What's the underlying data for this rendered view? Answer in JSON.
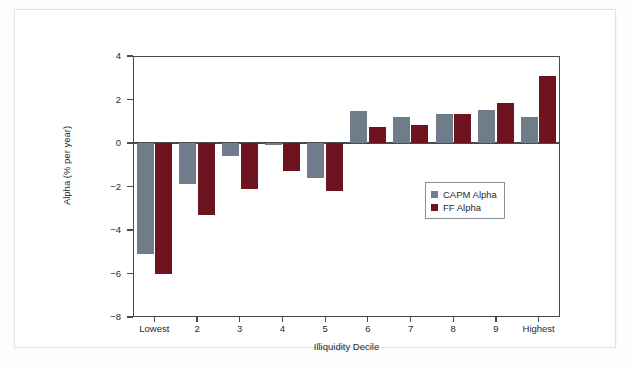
{
  "chart_data": {
    "type": "bar",
    "title": "",
    "xlabel": "Illiquidity Decile",
    "ylabel": "Alpha (% per year)",
    "categories": [
      "Lowest",
      "2",
      "3",
      "4",
      "5",
      "6",
      "7",
      "8",
      "9",
      "Highest"
    ],
    "series": [
      {
        "name": "CAPM Alpha",
        "color": "#6f7d8a",
        "values": [
          -5.1,
          -1.9,
          -0.6,
          -0.1,
          -1.6,
          1.45,
          1.2,
          1.35,
          1.5,
          1.2
        ]
      },
      {
        "name": "FF Alpha",
        "color": "#6d1420",
        "values": [
          -6.0,
          -3.3,
          -2.1,
          -1.3,
          -2.2,
          0.75,
          0.85,
          1.35,
          1.85,
          3.1
        ]
      }
    ],
    "ylim": [
      -8,
      4
    ],
    "yticks": [
      4,
      2,
      0,
      -2,
      -4,
      -6,
      -8
    ],
    "ytick_labels": [
      "4",
      "2",
      "0",
      "−2",
      "−4",
      "−6",
      "−8"
    ],
    "grid": false,
    "legend_position": "inside-center-right",
    "zero_line": true
  },
  "legend": {
    "entries": [
      {
        "label": "CAPM Alpha",
        "color": "#6f7d8a"
      },
      {
        "label": "FF Alpha",
        "color": "#6d1420"
      }
    ]
  }
}
